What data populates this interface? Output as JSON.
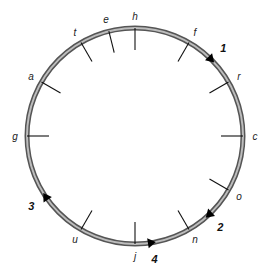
{
  "diagram": {
    "type": "circular track with labeled tick marks and numbered direction arrows",
    "center": [
      135,
      136
    ],
    "radius": 108,
    "ring_colors": {
      "outer": "#555555",
      "inner": "#bdbdbd"
    },
    "ticks": [
      {
        "label": "h",
        "angle": 0
      },
      {
        "label": "f",
        "angle": 30
      },
      {
        "label": "r",
        "angle": 60
      },
      {
        "label": "c",
        "angle": 90
      },
      {
        "label": "o",
        "angle": 120
      },
      {
        "label": "n",
        "angle": 150
      },
      {
        "label": "j",
        "angle": 180
      },
      {
        "label": "u",
        "angle": 210
      },
      {
        "label": "g",
        "angle": 270
      },
      {
        "label": "a",
        "angle": 300
      },
      {
        "label": "t",
        "angle": 330
      },
      {
        "label": "e",
        "angle": 346
      }
    ],
    "arrows": [
      {
        "label": "1",
        "angle": 45,
        "direction": "clockwise"
      },
      {
        "label": "2",
        "angle": 137,
        "direction": "clockwise"
      },
      {
        "label": "4",
        "angle": 171,
        "direction": "counterclockwise"
      },
      {
        "label": "3",
        "angle": 236,
        "direction": "clockwise"
      }
    ]
  }
}
